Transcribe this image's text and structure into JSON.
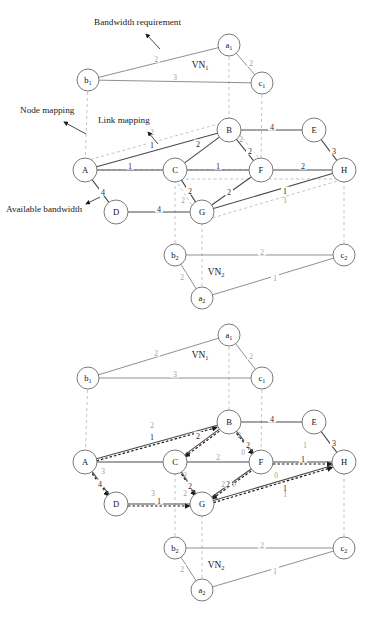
{
  "figure": {
    "annotations": [
      {
        "id": "bandwidth-requirement",
        "text": "Bandwidth requirement",
        "x": 94,
        "y": 25,
        "anchor": "start"
      },
      {
        "id": "node-mapping",
        "text": "Node mapping",
        "x": 20,
        "y": 113,
        "anchor": "start"
      },
      {
        "id": "link-mapping",
        "text": "Link mapping",
        "x": 98,
        "y": 123,
        "anchor": "start"
      },
      {
        "id": "available-bandwidth",
        "text": "Available bandwidth",
        "x": 6,
        "y": 212,
        "anchor": "start"
      }
    ]
  },
  "panels": [
    {
      "id": "panel-top",
      "offset_y": 0,
      "vn1": {
        "label": "VN",
        "sublabel": "1",
        "label_x": 200,
        "label_y": 68,
        "nodes": [
          {
            "id": "a1",
            "label": "a",
            "sub": "1",
            "x": 229,
            "y": 45,
            "r": 11
          },
          {
            "id": "b1",
            "label": "b",
            "sub": "1",
            "x": 88,
            "y": 80,
            "r": 11
          },
          {
            "id": "c1",
            "label": "c",
            "sub": "1",
            "x": 262,
            "y": 83,
            "r": 11
          }
        ],
        "links": [
          {
            "from": "b1",
            "to": "a1",
            "weight": "2",
            "lx": 156,
            "ly": 60
          },
          {
            "from": "a1",
            "to": "c1",
            "weight": "2",
            "lx": 251,
            "ly": 64
          },
          {
            "from": "b1",
            "to": "c1",
            "weight": "3",
            "lx": 175,
            "ly": 78
          }
        ]
      },
      "substrate": {
        "nodes": [
          {
            "id": "A",
            "label": "A",
            "x": 85,
            "y": 170,
            "r": 12
          },
          {
            "id": "B",
            "label": "B",
            "x": 229,
            "y": 130,
            "r": 12
          },
          {
            "id": "C",
            "label": "C",
            "x": 175,
            "y": 170,
            "r": 12
          },
          {
            "id": "D",
            "label": "D",
            "x": 116,
            "y": 212,
            "r": 12
          },
          {
            "id": "E",
            "label": "E",
            "x": 314,
            "y": 130,
            "r": 12
          },
          {
            "id": "F",
            "label": "F",
            "x": 261,
            "y": 170,
            "r": 12
          },
          {
            "id": "G",
            "label": "G",
            "x": 202,
            "y": 212,
            "r": 12
          },
          {
            "id": "H",
            "label": "H",
            "x": 344,
            "y": 170,
            "r": 12
          }
        ],
        "links": [
          {
            "from": "A",
            "to": "B",
            "weight": "1",
            "lx": 152,
            "ly": 146
          },
          {
            "from": "A",
            "to": "C",
            "weight": "1",
            "lx": 130,
            "ly": 167
          },
          {
            "from": "A",
            "to": "D",
            "weight": "4",
            "lx": 103,
            "ly": 193
          },
          {
            "from": "B",
            "to": "C",
            "weight": "2",
            "lx": 198,
            "ly": 145
          },
          {
            "from": "B",
            "to": "F",
            "weight": "2",
            "lx": 250,
            "ly": 152
          },
          {
            "from": "B",
            "to": "E",
            "weight": "4",
            "lx": 272,
            "ly": 128
          },
          {
            "from": "C",
            "to": "F",
            "weight": "1",
            "lx": 218,
            "ly": 167
          },
          {
            "from": "C",
            "to": "G",
            "weight": "2",
            "lx": 190,
            "ly": 192
          },
          {
            "from": "D",
            "to": "G",
            "weight": "4",
            "lx": 159,
            "ly": 210
          },
          {
            "from": "E",
            "to": "H",
            "weight": "3",
            "lx": 334,
            "ly": 152
          },
          {
            "from": "F",
            "to": "G",
            "weight": "2",
            "lx": 229,
            "ly": 193
          },
          {
            "from": "F",
            "to": "H",
            "weight": "2",
            "lx": 303,
            "ly": 167
          },
          {
            "from": "G",
            "to": "H",
            "weight": "1",
            "lx": 285,
            "ly": 192
          }
        ]
      },
      "vn2": {
        "label": "VN",
        "sublabel": "2",
        "label_x": 216,
        "label_y": 275,
        "nodes": [
          {
            "id": "b2",
            "label": "b",
            "sub": "2",
            "x": 175,
            "y": 255,
            "r": 11
          },
          {
            "id": "a2",
            "label": "a",
            "sub": "2",
            "x": 202,
            "y": 298,
            "r": 11
          },
          {
            "id": "c2",
            "label": "c",
            "sub": "2",
            "x": 344,
            "y": 255,
            "r": 11
          }
        ],
        "links": [
          {
            "from": "b2",
            "to": "c2",
            "weight": "2",
            "lx": 262,
            "ly": 253
          },
          {
            "from": "b2",
            "to": "a2",
            "weight": "2",
            "lx": 182,
            "ly": 278
          },
          {
            "from": "a2",
            "to": "c2",
            "weight": "1",
            "lx": 275,
            "ly": 279
          }
        ]
      },
      "node_mappings": [
        {
          "from": "b1",
          "to": "A"
        },
        {
          "from": "a1",
          "to": "B"
        },
        {
          "from": "c1",
          "to": "F"
        },
        {
          "from": "b2",
          "to": "C"
        },
        {
          "from": "a2",
          "to": "G"
        },
        {
          "from": "c2",
          "to": "H"
        }
      ],
      "link_mappings": [
        {
          "id": "lm-b1-a1",
          "path": [
            "A",
            "B"
          ],
          "weight": "2",
          "lx": 152,
          "ly": 135,
          "route": "above"
        },
        {
          "id": "lm-a1-c1",
          "path": [
            "B",
            "F"
          ],
          "weight": "2",
          "lx": 241,
          "ly": 142,
          "route": "direct"
        },
        {
          "id": "lm-b1-c1",
          "path": [
            "A",
            "C",
            "F"
          ],
          "weight": "",
          "lx": 0,
          "ly": 0,
          "route": "direct"
        },
        {
          "id": "lm-b2-a2",
          "path": [
            "C",
            "G"
          ],
          "weight": "2",
          "lx": 183,
          "ly": 203,
          "route": "direct"
        },
        {
          "id": "lm-b2-c2",
          "path": [
            "C",
            "F",
            "H"
          ],
          "weight": "",
          "lx": 0,
          "ly": 0,
          "route": "direct"
        },
        {
          "id": "lm-a2-c2",
          "path": [
            "G",
            "H"
          ],
          "weight": "1",
          "lx": 285,
          "ly": 203,
          "route": "direct"
        }
      ]
    },
    {
      "id": "panel-bottom",
      "offset_y": 312,
      "vn1": {
        "label": "VN",
        "sublabel": "1",
        "label_x": 200,
        "label_y": 358,
        "nodes": [
          {
            "id": "a1",
            "label": "a",
            "sub": "1",
            "x": 229,
            "y": 335,
            "r": 11
          },
          {
            "id": "b1",
            "label": "b",
            "sub": "1",
            "x": 88,
            "y": 378,
            "r": 11
          },
          {
            "id": "c1",
            "label": "c",
            "sub": "1",
            "x": 262,
            "y": 378,
            "r": 11
          }
        ],
        "links": [
          {
            "from": "b1",
            "to": "a1",
            "weight": "2",
            "lx": 156,
            "ly": 354
          },
          {
            "from": "a1",
            "to": "c1",
            "weight": "2",
            "lx": 251,
            "ly": 357
          },
          {
            "from": "b1",
            "to": "c1",
            "weight": "3",
            "lx": 175,
            "ly": 375
          }
        ]
      },
      "substrate": {
        "nodes": [
          {
            "id": "A",
            "label": "A",
            "x": 85,
            "y": 462,
            "r": 12
          },
          {
            "id": "B",
            "label": "B",
            "x": 229,
            "y": 422,
            "r": 12
          },
          {
            "id": "C",
            "label": "C",
            "x": 175,
            "y": 462,
            "r": 12
          },
          {
            "id": "D",
            "label": "D",
            "x": 116,
            "y": 504,
            "r": 12
          },
          {
            "id": "E",
            "label": "E",
            "x": 314,
            "y": 422,
            "r": 12
          },
          {
            "id": "F",
            "label": "F",
            "x": 261,
            "y": 462,
            "r": 12
          },
          {
            "id": "G",
            "label": "G",
            "x": 202,
            "y": 504,
            "r": 12
          },
          {
            "id": "H",
            "label": "H",
            "x": 344,
            "y": 462,
            "r": 12
          }
        ],
        "links": [
          {
            "from": "A",
            "to": "B",
            "weight": "1",
            "lx": 152,
            "ly": 438
          },
          {
            "from": "A",
            "to": "C",
            "weight": "",
            "lx": 0,
            "ly": 0
          },
          {
            "from": "A",
            "to": "D",
            "weight": "4",
            "lx": 100,
            "ly": 485
          },
          {
            "from": "B",
            "to": "C",
            "weight": "2",
            "lx": 198,
            "ly": 437
          },
          {
            "from": "B",
            "to": "F",
            "weight": "2",
            "lx": 248,
            "ly": 446
          },
          {
            "from": "B",
            "to": "E",
            "weight": "4",
            "lx": 272,
            "ly": 420
          },
          {
            "from": "C",
            "to": "F",
            "weight": "",
            "lx": 0,
            "ly": 0
          },
          {
            "from": "C",
            "to": "G",
            "weight": "2",
            "lx": 190,
            "ly": 487
          },
          {
            "from": "D",
            "to": "G",
            "weight": "1",
            "lx": 159,
            "ly": 502
          },
          {
            "from": "E",
            "to": "H",
            "weight": "3",
            "lx": 334,
            "ly": 444
          },
          {
            "from": "F",
            "to": "G",
            "weight": "2",
            "lx": 228,
            "ly": 485
          },
          {
            "from": "F",
            "to": "H",
            "weight": "1",
            "lx": 303,
            "ly": 460
          },
          {
            "from": "G",
            "to": "H",
            "weight": "1",
            "lx": 285,
            "ly": 489
          }
        ]
      },
      "vn2": {
        "label": "VN",
        "sublabel": "2",
        "label_x": 216,
        "label_y": 568,
        "nodes": [
          {
            "id": "b2",
            "label": "b",
            "sub": "2",
            "x": 175,
            "y": 548,
            "r": 11
          },
          {
            "id": "a2",
            "label": "a",
            "sub": "2",
            "x": 202,
            "y": 590,
            "r": 11
          },
          {
            "id": "c2",
            "label": "c",
            "sub": "2",
            "x": 344,
            "y": 548,
            "r": 11
          }
        ],
        "links": [
          {
            "from": "b2",
            "to": "c2",
            "weight": "2",
            "lx": 262,
            "ly": 546
          },
          {
            "from": "b2",
            "to": "a2",
            "weight": "2",
            "lx": 182,
            "ly": 570
          },
          {
            "from": "a2",
            "to": "c2",
            "weight": "1",
            "lx": 275,
            "ly": 572
          }
        ]
      },
      "node_mappings": [
        {
          "from": "b1",
          "to": "A"
        },
        {
          "from": "a1",
          "to": "B"
        },
        {
          "from": "c1",
          "to": "F"
        },
        {
          "from": "b2",
          "to": "C"
        },
        {
          "from": "a2",
          "to": "G"
        },
        {
          "from": "c2",
          "to": "H"
        }
      ],
      "residual_labels": [
        {
          "id": "res-AB",
          "text": "2",
          "x": 152,
          "y": 428
        },
        {
          "id": "res-AD",
          "text": "3",
          "x": 103,
          "y": 474
        },
        {
          "id": "res-DG",
          "text": "3",
          "x": 153,
          "y": 496
        },
        {
          "id": "res-CG",
          "text": "2",
          "x": 185,
          "y": 496
        },
        {
          "id": "res-CG2",
          "text": "2",
          "x": 185,
          "y": 478
        },
        {
          "id": "res-BF",
          "text": "0",
          "x": 243,
          "y": 455
        },
        {
          "id": "res-BF2",
          "text": "2",
          "x": 239,
          "y": 438
        },
        {
          "id": "res-FG",
          "text": "0",
          "x": 234,
          "y": 487
        },
        {
          "id": "res-FG2",
          "text": "2",
          "x": 223,
          "y": 487
        },
        {
          "id": "res-FH",
          "text": "1",
          "x": 305,
          "y": 448
        },
        {
          "id": "res-GH",
          "text": "0",
          "x": 276,
          "y": 478
        },
        {
          "id": "res-GH2",
          "text": "1",
          "x": 285,
          "y": 497
        },
        {
          "id": "res-CF",
          "text": "2",
          "x": 218,
          "y": 460
        }
      ]
    }
  ],
  "colors": {
    "substrate_link": "#4a4a4a",
    "virtual_link": "#8a8a8a",
    "node_stroke": "#6b6b6b",
    "mapping_dash": "#b5b5b5",
    "embedded_path": "#1a1a1a",
    "text": "#1a1a1a",
    "background": "#ffffff"
  }
}
